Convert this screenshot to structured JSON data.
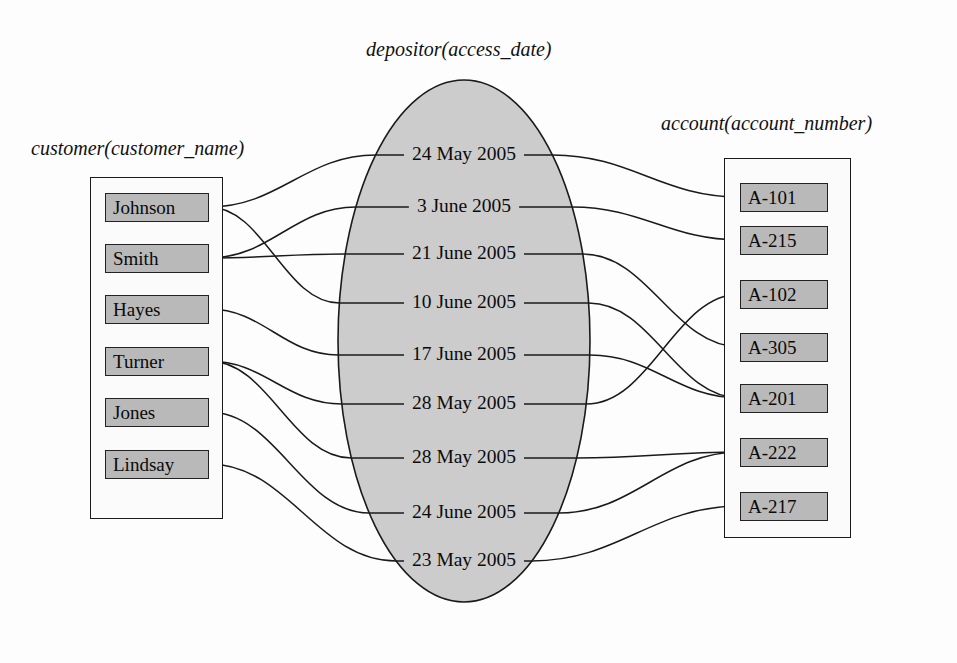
{
  "diagram": {
    "kind": "er-relationship-set",
    "width": 957,
    "height": 663,
    "colors": {
      "value_fill": "#b9b9b9",
      "ellipse_fill": "#cccccc",
      "stroke": "#1a1a1a",
      "background": "#fdfdfd"
    }
  },
  "customer": {
    "title": "customer(customer_name)",
    "values": [
      {
        "label": "Johnson",
        "y": 207
      },
      {
        "label": "Smith",
        "y": 258
      },
      {
        "label": "Hayes",
        "y": 309
      },
      {
        "label": "Turner",
        "y": 361
      },
      {
        "label": "Jones",
        "y": 412
      },
      {
        "label": "Lindsay",
        "y": 464
      }
    ]
  },
  "depositor": {
    "title": "depositor(access_date)",
    "ellipse": {
      "cx": 464,
      "cy": 341,
      "rx": 126,
      "ry": 261
    },
    "values": [
      {
        "label": "24 May 2005",
        "y": 155
      },
      {
        "label": "3 June 2005",
        "y": 207
      },
      {
        "label": "21 June 2005",
        "y": 254
      },
      {
        "label": "10 June 2005",
        "y": 303
      },
      {
        "label": "17 June 2005",
        "y": 355
      },
      {
        "label": "28 May 2005",
        "y": 404
      },
      {
        "label": "28 May 2005",
        "y": 458
      },
      {
        "label": "24 June 2005",
        "y": 513
      },
      {
        "label": "23 May 2005",
        "y": 561
      }
    ]
  },
  "account": {
    "title": "account(account_number)",
    "values": [
      {
        "label": "A-101",
        "y": 197
      },
      {
        "label": "A-215",
        "y": 240
      },
      {
        "label": "A-102",
        "y": 294
      },
      {
        "label": "A-305",
        "y": 347
      },
      {
        "label": "A-201",
        "y": 398
      },
      {
        "label": "A-222",
        "y": 452
      },
      {
        "label": "A-217",
        "y": 506
      }
    ]
  },
  "links": {
    "customer_to_date": [
      {
        "customer": "Johnson",
        "date_index": 0
      },
      {
        "customer": "Johnson",
        "date_index": 3
      },
      {
        "customer": "Smith",
        "date_index": 1
      },
      {
        "customer": "Smith",
        "date_index": 2
      },
      {
        "customer": "Hayes",
        "date_index": 4
      },
      {
        "customer": "Turner",
        "date_index": 5
      },
      {
        "customer": "Turner",
        "date_index": 6
      },
      {
        "customer": "Jones",
        "date_index": 7
      },
      {
        "customer": "Lindsay",
        "date_index": 8
      }
    ],
    "date_to_account": [
      {
        "date_index": 0,
        "account": "A-101"
      },
      {
        "date_index": 1,
        "account": "A-215"
      },
      {
        "date_index": 2,
        "account": "A-305"
      },
      {
        "date_index": 3,
        "account": "A-201"
      },
      {
        "date_index": 4,
        "account": "A-201"
      },
      {
        "date_index": 5,
        "account": "A-102"
      },
      {
        "date_index": 6,
        "account": "A-222"
      },
      {
        "date_index": 7,
        "account": "A-222"
      },
      {
        "date_index": 8,
        "account": "A-217"
      }
    ]
  }
}
